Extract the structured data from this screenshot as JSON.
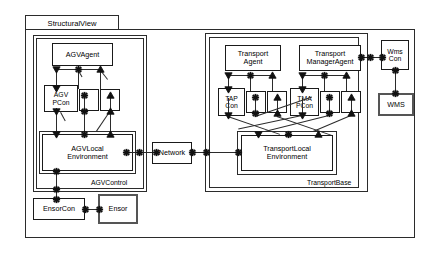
{
  "diagram": {
    "title": "StructuralView",
    "type": "uml-composite-structure",
    "colors": {
      "stroke": "#2b2b2b",
      "fill": "#ffffff",
      "emphasis_stroke": "#555555",
      "port_fill": "#111111"
    },
    "packages": [
      {
        "id": "structural-view",
        "label": "StructuralView"
      },
      {
        "id": "agv-control",
        "label": "AGVControl"
      },
      {
        "id": "transport-base",
        "label": "TransportBase"
      }
    ],
    "components": [
      {
        "id": "agv-agent",
        "label": "AGVAgent",
        "lines": [
          "AGVAgent"
        ]
      },
      {
        "id": "agv-pcon",
        "label": "AGV PCon",
        "lines": [
          "AGV",
          "PCon"
        ]
      },
      {
        "id": "agv-local-environment",
        "label": "AGVLocalEnvironment",
        "lines": [
          "AGVLocal",
          "Environment"
        ]
      },
      {
        "id": "ensorcon",
        "label": "EnsorCon",
        "lines": [
          "EnsorCon"
        ]
      },
      {
        "id": "ensor",
        "label": "Ensor",
        "lines": [
          "Ensor"
        ]
      },
      {
        "id": "network",
        "label": "Network",
        "lines": [
          "Network"
        ]
      },
      {
        "id": "transport-agent",
        "label": "TransportAgent",
        "lines": [
          "Transport",
          "Agent"
        ]
      },
      {
        "id": "tap-con",
        "label": "TAP Con",
        "lines": [
          "TAP",
          "Con"
        ]
      },
      {
        "id": "transport-manager-agent",
        "label": "TransportManagerAgent",
        "lines": [
          "Transport",
          "ManagerAgent"
        ]
      },
      {
        "id": "tma-pcon",
        "label": "TMA PCon",
        "lines": [
          "TMA",
          "PCon"
        ]
      },
      {
        "id": "transport-local-environment",
        "label": "TransportLocalEnvironment",
        "lines": [
          "TransportLocal",
          "Environment"
        ]
      },
      {
        "id": "wms-con",
        "label": "Wms Con",
        "lines": [
          "Wms",
          "Con"
        ]
      },
      {
        "id": "wms",
        "label": "WMS",
        "lines": [
          "WMS"
        ]
      }
    ],
    "port_kinds": [
      {
        "id": "down-triangle-port",
        "glyph": "triangle-down"
      },
      {
        "id": "star-port",
        "glyph": "star"
      },
      {
        "id": "up-triangle-port",
        "glyph": "triangle-up"
      },
      {
        "id": "dot-port",
        "glyph": "star"
      }
    ],
    "text": {
      "structural_view": "StructuralView",
      "agv_control": "AGVControl",
      "transport_base": "TransportBase",
      "agv_agent": "AGVAgent",
      "agv": "AGV",
      "pcon": "PCon",
      "agv_local": "AGVLocal",
      "environment": "Environment",
      "ensorcon": "EnsorCon",
      "ensor": "Ensor",
      "network": "Network",
      "transport": "Transport",
      "agent": "Agent",
      "tap": "TAP",
      "con": "Con",
      "manager_agent": "ManagerAgent",
      "tma": "TMA",
      "tma_pcon": "PCon",
      "transport_local": "TransportLocal",
      "environment2": "Environment",
      "wms_upper": "Wms",
      "wms_con": "Con",
      "wms": "WMS"
    }
  }
}
